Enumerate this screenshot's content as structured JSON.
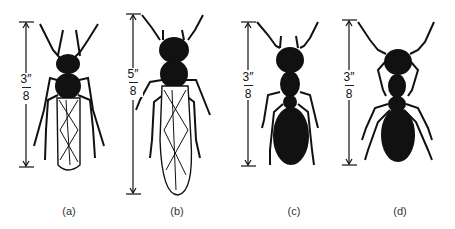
{
  "figure": {
    "panels": [
      {
        "id": "a",
        "caption": "(a)",
        "scale_numerator": "3″",
        "scale_denominator": "8",
        "length_in": "3/8",
        "wings": true,
        "body": "winged termite"
      },
      {
        "id": "b",
        "caption": "(b)",
        "scale_numerator": "5″",
        "scale_denominator": "8",
        "length_in": "5/8",
        "wings": true,
        "body": "winged ant"
      },
      {
        "id": "c",
        "caption": "(c)",
        "scale_numerator": "3″",
        "scale_denominator": "8",
        "length_in": "3/8",
        "wings": false,
        "body": "worker ant"
      },
      {
        "id": "d",
        "caption": "(d)",
        "scale_numerator": "3″",
        "scale_denominator": "8",
        "length_in": "3/8",
        "wings": false,
        "body": "worker ant"
      }
    ],
    "colors": {
      "ink": "#111111",
      "background": "#ffffff"
    }
  }
}
